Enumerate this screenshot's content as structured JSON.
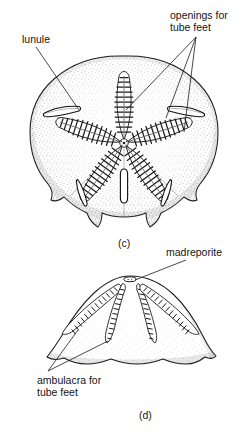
{
  "figure": {
    "kind": "scientific-illustration",
    "background_color": "#ffffff",
    "ink_color": "#1a1a1a",
    "panels": [
      {
        "id": "c",
        "caption": "(c)",
        "view": "aboral (top) view",
        "callouts": [
          "lunule",
          "openings for tube feet"
        ]
      },
      {
        "id": "d",
        "caption": "(d)",
        "view": "lateral (side) view",
        "callouts": [
          "madreporite",
          "ambulacra for tube feet"
        ]
      }
    ]
  },
  "labels": {
    "lunule": "lunule",
    "openings_for_tube_feet_line1": "openings for",
    "openings_for_tube_feet_line2": "tube feet",
    "madreporite": "madreporite",
    "ambulacra_for_tube_feet_line1": "ambulacra for",
    "ambulacra_for_tube_feet_line2": "tube feet"
  },
  "captions": {
    "panel_c": "(c)",
    "panel_d": "(d)"
  }
}
